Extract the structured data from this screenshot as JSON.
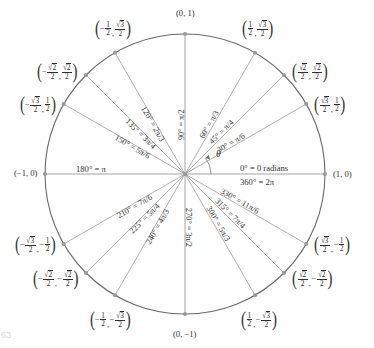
{
  "figure": {
    "type": "unit-circle",
    "page_artifact": "63",
    "center": {
      "x": 185,
      "y": 174
    },
    "radius": 140,
    "theta_symbol": "θ"
  },
  "axis_labels": {
    "right_top": "0° = 0 radians",
    "right_bottom": "360° = 2π",
    "left": "180° = π",
    "point_right": "(1, 0)",
    "point_left": "(−1, 0)",
    "point_top": "(0, 1)",
    "point_bottom": "(0, −1)"
  },
  "chart_data": {
    "type": "scatter",
    "xlabel": "",
    "ylabel": "",
    "xlim": [
      -1,
      1
    ],
    "ylim": [
      -1,
      1
    ],
    "grid": false,
    "legend": "none",
    "points": [
      {
        "deg": 0,
        "angle_label": "0° = 0 radians",
        "radian": "0",
        "x": "1",
        "y": "0",
        "coord_text": "(1, 0)",
        "plain": true
      },
      {
        "deg": 30,
        "angle_label": "30° = π/6",
        "radian": "π/6",
        "x": "√3/2",
        "y": "1/2",
        "nx": 1,
        "dx": "3",
        "ny": "1",
        "dy": "2",
        "style": "r3_half"
      },
      {
        "deg": 45,
        "angle_label": "45° = π/4",
        "radian": "π/4",
        "x": "√2/2",
        "y": "√2/2",
        "style": "r2_r2"
      },
      {
        "deg": 60,
        "angle_label": "60° = π/3",
        "radian": "π/3",
        "x": "1/2",
        "y": "√3/2",
        "style": "half_r3"
      },
      {
        "deg": 90,
        "angle_label": "90° = π/2",
        "radian": "π/2",
        "x": "0",
        "y": "1",
        "coord_text": "(0, 1)",
        "plain": true
      },
      {
        "deg": 120,
        "angle_label": "120° = 2π/3",
        "radian": "2π/3",
        "x": "−1/2",
        "y": "√3/2",
        "style": "half_r3",
        "negx": true
      },
      {
        "deg": 135,
        "angle_label": "135° = 3π/4",
        "radian": "3π/4",
        "x": "−√2/2",
        "y": "√2/2",
        "style": "r2_r2",
        "negx": true
      },
      {
        "deg": 150,
        "angle_label": "150° = 5π/6",
        "radian": "5π/6",
        "x": "−√3/2",
        "y": "1/2",
        "style": "r3_half",
        "negx": true
      },
      {
        "deg": 180,
        "angle_label": "180° = π",
        "radian": "π",
        "x": "−1",
        "y": "0",
        "coord_text": "(−1, 0)",
        "plain": true
      },
      {
        "deg": 210,
        "angle_label": "210° = 7π/6",
        "radian": "7π/6",
        "x": "−√3/2",
        "y": "−1/2",
        "style": "r3_half",
        "negx": true,
        "negy": true
      },
      {
        "deg": 225,
        "angle_label": "225° = 5π/4",
        "radian": "5π/4",
        "x": "−√2/2",
        "y": "−√2/2",
        "style": "r2_r2",
        "negx": true,
        "negy": true
      },
      {
        "deg": 240,
        "angle_label": "240° = 4π/3",
        "radian": "4π/3",
        "x": "−1/2",
        "y": "−√3/2",
        "style": "half_r3",
        "negx": true,
        "negy": true
      },
      {
        "deg": 270,
        "angle_label": "270° = 3π/2",
        "radian": "3π/2",
        "x": "0",
        "y": "−1",
        "coord_text": "(0, −1)",
        "plain": true
      },
      {
        "deg": 300,
        "angle_label": "300° = 5π/3",
        "radian": "5π/3",
        "x": "1/2",
        "y": "−√3/2",
        "style": "half_r3",
        "negy": true
      },
      {
        "deg": 315,
        "angle_label": "315° = 7π/4",
        "radian": "7π/4",
        "x": "√2/2",
        "y": "−√2/2",
        "style": "r2_r2",
        "negy": true
      },
      {
        "deg": 330,
        "angle_label": "330° = 11π/6",
        "radian": "11π/6",
        "x": "√3/2",
        "y": "−1/2",
        "style": "r3_half",
        "negy": true
      },
      {
        "deg": 360,
        "angle_label": "360° = 2π",
        "radian": "2π",
        "x": "1",
        "y": "0",
        "coord_text": "(1, 0)",
        "plain": true
      }
    ]
  }
}
